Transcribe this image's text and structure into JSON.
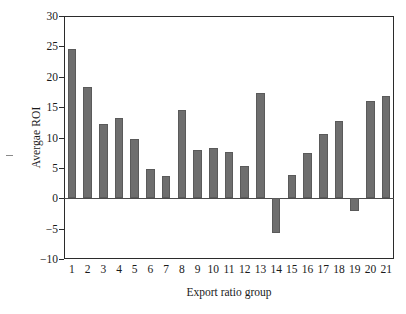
{
  "chart_data": {
    "type": "bar",
    "title": "",
    "xlabel": "Export ratio group",
    "ylabel": "Avergae ROI",
    "categories": [
      "1",
      "2",
      "3",
      "4",
      "5",
      "6",
      "7",
      "8",
      "9",
      "10",
      "11",
      "12",
      "13",
      "14",
      "15",
      "16",
      "17",
      "18",
      "19",
      "20",
      "21"
    ],
    "values": [
      24.6,
      18.3,
      12.3,
      13.2,
      9.8,
      4.8,
      3.7,
      14.5,
      7.9,
      8.3,
      7.6,
      5.3,
      17.3,
      -5.8,
      3.9,
      7.4,
      10.5,
      12.7,
      -2.1,
      16.0,
      16.9
    ],
    "ylim": [
      -10,
      30
    ],
    "yticks": [
      30,
      25,
      20,
      15,
      10,
      5,
      0,
      -5,
      -10
    ],
    "ytick_labels": [
      "30",
      "25",
      "20",
      "15",
      "10",
      "5",
      "0",
      "−5",
      "−10"
    ],
    "grid": false,
    "legend": null,
    "bar_color": "#6e6e6e",
    "bar_edge_color": "#5a5a5a",
    "axis_color": "#2b2b2b",
    "background": "#ffffff"
  },
  "axes": {
    "y_title": "Avergae ROI",
    "x_title": "Export ratio group"
  }
}
